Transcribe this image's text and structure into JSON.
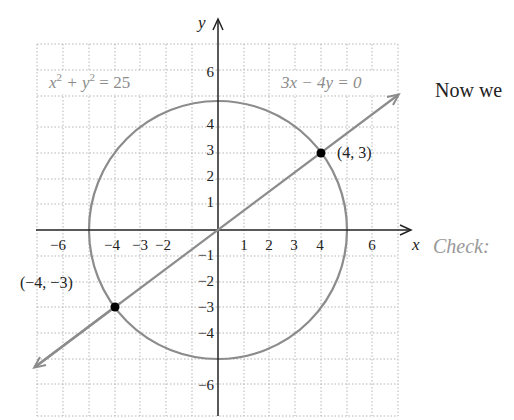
{
  "figure": {
    "circle_label": "x² + y² = 25",
    "circle_label_base": "x",
    "circle_label_mid": " + y",
    "circle_label_end": " = 25",
    "circle_label_sup": "2",
    "line_label": "3x − 4y = 0",
    "axis_x_label": "x",
    "axis_y_label": "y",
    "x_ticks": [
      "−6",
      "−4",
      "−3",
      "−2",
      "1",
      "2",
      "3",
      "4",
      "6"
    ],
    "y_ticks": [
      "6",
      "4",
      "3",
      "2",
      "1",
      "−1",
      "−2",
      "−3",
      "−4",
      "−6"
    ],
    "points": [
      {
        "label": "(4, 3)",
        "x": 4,
        "y": 3
      },
      {
        "label": "(−4, −3)",
        "x": -4,
        "y": -3
      }
    ],
    "colors": {
      "curve": "#8c8c8c",
      "axis": "#222222",
      "grid": "#b5b5b5",
      "point": "#000000"
    }
  },
  "side_text": {
    "intro": "Now we",
    "check": "Check:"
  }
}
